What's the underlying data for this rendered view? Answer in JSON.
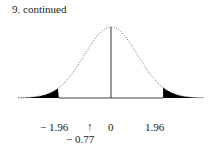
{
  "header": {
    "title": "9.  continued"
  },
  "chart_data": {
    "type": "area",
    "title": "9. continued",
    "xlabel": "",
    "ylabel": "",
    "xlim": [
      -3.5,
      3.5
    ],
    "mean": 0,
    "critical_values": [
      -1.96,
      1.96
    ],
    "shaded_regions": [
      [
        -3.5,
        -1.96
      ],
      [
        1.96,
        3.5
      ]
    ],
    "marker": {
      "value": -0.77,
      "symbol": "↑"
    },
    "tick_labels": [
      "− 1.96",
      "↑",
      "0",
      "1.96"
    ],
    "marker_label": "− 0.77",
    "grid": false,
    "legend": null
  },
  "labels": {
    "left_crit": "− 1.96",
    "arrow": "↑",
    "center": "0",
    "right_crit": "1.96",
    "test_stat": "− 0.77"
  }
}
